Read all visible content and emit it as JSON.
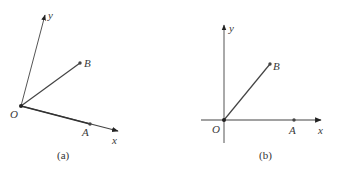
{
  "figure": {
    "stroke_color": "#444444",
    "point_color": "#333333",
    "panels": [
      {
        "id": "a",
        "caption": "(a)",
        "description": "Oblique coordinate system: axes Ox and Oy not perpendicular",
        "origin": {
          "label": "O",
          "x": 21,
          "y": 106
        },
        "x_axis": {
          "label": "x",
          "from": [
            21,
            106
          ],
          "to": [
            119,
            131
          ]
        },
        "y_axis": {
          "label": "y",
          "from": [
            21,
            106
          ],
          "to": [
            45,
            14
          ]
        },
        "points": [
          {
            "label": "A",
            "x": 90,
            "y": 124,
            "on": "x-axis"
          },
          {
            "label": "B",
            "x": 80,
            "y": 63,
            "segment_from_origin": true
          }
        ]
      },
      {
        "id": "b",
        "caption": "(b)",
        "description": "Rectangular coordinate system: axes Ox and Oy perpendicular",
        "origin": {
          "label": "O",
          "x": 224,
          "y": 120
        },
        "x_axis": {
          "label": "x",
          "from": [
            201,
            120
          ],
          "to": [
            322,
            120
          ]
        },
        "y_axis": {
          "label": "y",
          "from": [
            224,
            143
          ],
          "to": [
            224,
            24
          ]
        },
        "points": [
          {
            "label": "A",
            "x": 294,
            "y": 120,
            "on": "x-axis"
          },
          {
            "label": "B",
            "x": 270,
            "y": 64,
            "segment_from_origin": true
          }
        ]
      }
    ]
  },
  "labels": {
    "a_y": "y",
    "a_B": "B",
    "a_O": "O",
    "a_A": "A",
    "a_x": "x",
    "a_caption": "(a)",
    "b_y": "y",
    "b_B": "B",
    "b_O": "O",
    "b_A": "A",
    "b_x": "x",
    "b_caption": "(b)"
  }
}
